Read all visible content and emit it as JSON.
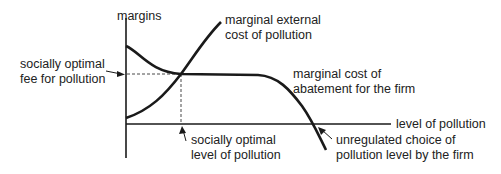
{
  "diagram": {
    "axes": {
      "y_label": "margins",
      "x_label": "level of pollution"
    },
    "curves": {
      "external_cost_label_1": "marginal external",
      "external_cost_label_2": "cost of pollution",
      "abatement_label_1": "marginal cost of",
      "abatement_label_2": "abatement for the firm"
    },
    "annotations": {
      "fee_label_1": "socially optimal",
      "fee_label_2": "fee for pollution",
      "optimal_level_label_1": "socially optimal",
      "optimal_level_label_2": "level of pollution",
      "unregulated_label_1": "unregulated choice of",
      "unregulated_label_2": "pollution level by the firm"
    },
    "colors": {
      "line": "#1a1a1a",
      "text": "#222222"
    }
  }
}
